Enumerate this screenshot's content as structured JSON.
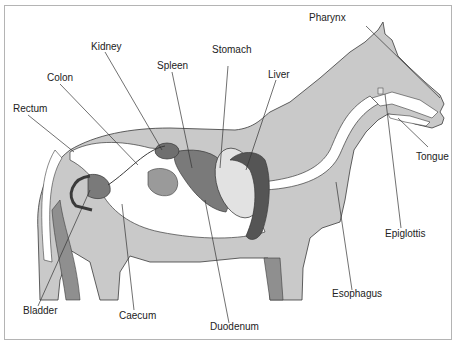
{
  "diagram": {
    "colors": {
      "body": "#c9c9c9",
      "organ_dark": "#555555",
      "organ_mid": "#7a7a7a",
      "organ_light": "#e2e2e2",
      "intestine": "#ffffff",
      "outline": "#3a3a3a",
      "frame": "#b4b4b4"
    },
    "labels": {
      "pharynx": "Pharynx",
      "stomach": "Stomach",
      "kidney": "Kidney",
      "spleen": "Spleen",
      "liver": "Liver",
      "colon": "Colon",
      "rectum": "Rectum",
      "tongue": "Tongue",
      "epiglottis": "Epiglottis",
      "esophagus": "Esophagus",
      "bladder": "Bladder",
      "caecum": "Caecum",
      "duodenum": "Duodenum"
    }
  }
}
